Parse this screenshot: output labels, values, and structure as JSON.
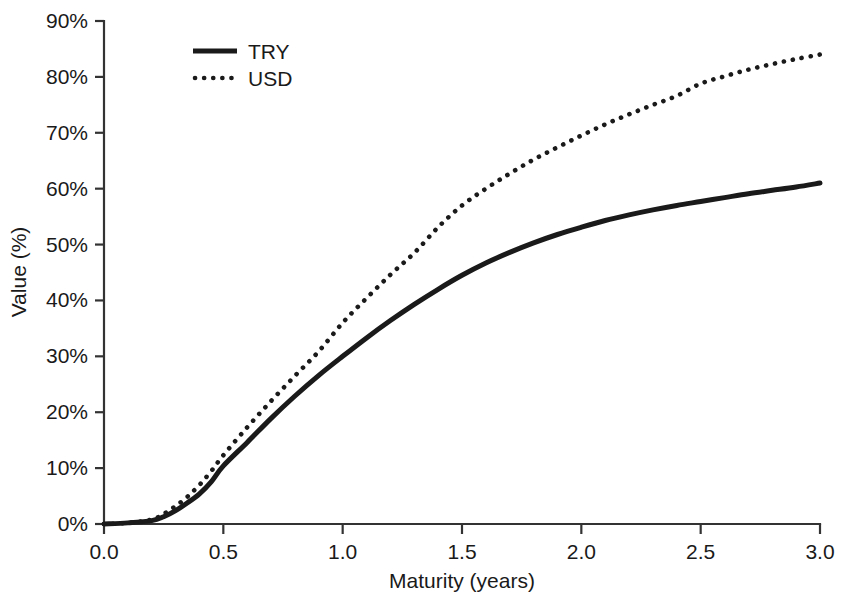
{
  "chart_data": {
    "type": "line",
    "title": "",
    "xlabel": "Maturity (years)",
    "ylabel": "Value (%)",
    "xlim": [
      0.0,
      3.0
    ],
    "ylim": [
      0,
      90
    ],
    "grid": false,
    "legend_position": "top-left",
    "x_tick_labels": [
      "0.0",
      "0.5",
      "1.0",
      "1.5",
      "2.0",
      "2.5",
      "3.0"
    ],
    "x_ticks": [
      0.0,
      0.5,
      1.0,
      1.5,
      2.0,
      2.5,
      3.0
    ],
    "y_tick_labels": [
      "0%",
      "10%",
      "20%",
      "30%",
      "40%",
      "50%",
      "60%",
      "70%",
      "80%",
      "90%"
    ],
    "y_ticks": [
      0,
      10,
      20,
      30,
      40,
      50,
      60,
      70,
      80,
      90
    ],
    "x": [
      0.0,
      0.1,
      0.2,
      0.25,
      0.3,
      0.35,
      0.4,
      0.45,
      0.5,
      0.6,
      0.7,
      0.8,
      0.9,
      1.0,
      1.1,
      1.2,
      1.3,
      1.4,
      1.5,
      1.6,
      1.7,
      1.8,
      1.9,
      2.0,
      2.1,
      2.2,
      2.3,
      2.4,
      2.5,
      2.6,
      2.7,
      2.8,
      2.9,
      3.0
    ],
    "series": [
      {
        "name": "TRY",
        "style": "solid",
        "values": [
          0.0,
          0.2,
          0.6,
          1.3,
          2.4,
          3.8,
          5.4,
          7.6,
          10.4,
          14.6,
          18.9,
          22.9,
          26.6,
          30.0,
          33.3,
          36.4,
          39.3,
          42.0,
          44.5,
          46.7,
          48.6,
          50.3,
          51.8,
          53.1,
          54.3,
          55.3,
          56.2,
          57.0,
          57.7,
          58.4,
          59.1,
          59.7,
          60.3,
          61.0
        ]
      },
      {
        "name": "USD",
        "style": "dotted",
        "values": [
          0.0,
          0.2,
          0.8,
          1.8,
          3.2,
          4.9,
          7.0,
          9.5,
          12.3,
          17.3,
          22.0,
          26.5,
          30.9,
          36.0,
          40.4,
          44.6,
          48.5,
          53.1,
          57.0,
          60.0,
          62.7,
          65.2,
          67.4,
          69.5,
          71.5,
          73.3,
          75.0,
          76.6,
          78.8,
          80.1,
          81.3,
          82.3,
          83.2,
          84.0
        ]
      }
    ],
    "colors": {
      "series": "#1a1a1a",
      "axis": "#333333",
      "background": "#ffffff"
    }
  }
}
